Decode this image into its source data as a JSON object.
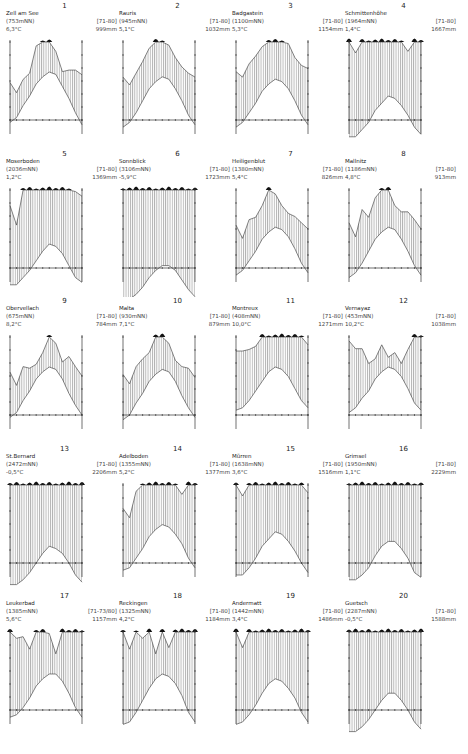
{
  "figure": {
    "layout": {
      "columns": 4,
      "rows": 5
    }
  },
  "chart_data": {
    "type": "climate-diagram-grid",
    "months": [
      "J",
      "F",
      "M",
      "A",
      "M",
      "J",
      "J",
      "A",
      "S",
      "O",
      "N",
      "D"
    ],
    "period_default": "[71-80]",
    "stations": [
      {
        "num": "1",
        "name": "Zell am See",
        "alt": "(753mNN)",
        "period": "[71-80]",
        "temp": "6,3°C",
        "precip": "999mm",
        "p": [
          48,
          35,
          52,
          60,
          95,
          100,
          100,
          88,
          62,
          64,
          64,
          58
        ],
        "t": [
          -1,
          1,
          6,
          10,
          15,
          18,
          20,
          19,
          14,
          9,
          3,
          -2
        ]
      },
      {
        "num": "2",
        "name": "Rauris",
        "alt": "(945mNN)",
        "period": "[71-80]",
        "temp": "5,1°C",
        "precip": "1032mm",
        "p": [
          55,
          45,
          60,
          75,
          92,
          100,
          100,
          96,
          80,
          68,
          60,
          55
        ],
        "t": [
          -3,
          -1,
          3,
          8,
          13,
          16,
          18,
          17,
          13,
          8,
          2,
          -2
        ]
      },
      {
        "num": "3",
        "name": "Badgastein",
        "alt": "(1100mNN)",
        "period": "[71-80]",
        "temp": "5,3°C",
        "precip": "1154mm",
        "p": [
          62,
          55,
          72,
          82,
          94,
          100,
          100,
          100,
          98,
          80,
          70,
          66
        ],
        "t": [
          -3,
          -1,
          3,
          7,
          12,
          15,
          17,
          16,
          13,
          8,
          2,
          -2
        ]
      },
      {
        "num": "4",
        "name": "Schmittenhöhe",
        "alt": "(1964mNN)",
        "period": "[71-80]",
        "temp": "1,4°C",
        "precip": "1667mm",
        "p": [
          100,
          86,
          100,
          100,
          100,
          100,
          100,
          100,
          100,
          88,
          100,
          100
        ],
        "t": [
          -7,
          -7,
          -4,
          -1,
          4,
          7,
          10,
          9,
          6,
          2,
          -3,
          -6
        ]
      },
      {
        "num": "5",
        "name": "Moserboden",
        "alt": "(2036mNN)",
        "period": "[71-80]",
        "temp": "1,2°C",
        "precip": "1369mm",
        "p": [
          80,
          55,
          100,
          100,
          100,
          100,
          100,
          100,
          100,
          100,
          98,
          92
        ],
        "t": [
          -7,
          -7,
          -4,
          -1,
          3,
          7,
          10,
          9,
          6,
          1,
          -4,
          -6
        ]
      },
      {
        "num": "6",
        "name": "Sonnblick",
        "alt": "(3106mNN)",
        "period": "[71-80]",
        "temp": "-5,9°C",
        "precip": "1723mm",
        "p": [
          100,
          100,
          100,
          100,
          100,
          100,
          100,
          100,
          100,
          100,
          100,
          100
        ],
        "t": [
          -13,
          -13,
          -11,
          -8,
          -4,
          -1,
          1,
          1,
          -1,
          -5,
          -9,
          -12
        ]
      },
      {
        "num": "7",
        "name": "Heiligenblut",
        "alt": "(1380mNN)",
        "period": "[71-80]",
        "temp": "5,4°C",
        "precip": "826mm",
        "p": [
          55,
          38,
          62,
          65,
          80,
          100,
          95,
          80,
          70,
          66,
          58,
          50
        ],
        "t": [
          -3,
          -1,
          3,
          7,
          12,
          15,
          17,
          16,
          13,
          8,
          2,
          -2
        ]
      },
      {
        "num": "8",
        "name": "Mallnitz",
        "alt": "(1186mNN)",
        "period": "[71-80]",
        "temp": "4,8°C",
        "precip": "913mm",
        "p": [
          58,
          40,
          75,
          65,
          90,
          100,
          100,
          80,
          72,
          72,
          62,
          50
        ],
        "t": [
          -4,
          -2,
          2,
          7,
          12,
          15,
          17,
          16,
          12,
          7,
          1,
          -3
        ]
      },
      {
        "num": "9",
        "name": "Obervellach",
        "alt": "(675mNN)",
        "period": "[71-80]",
        "temp": "8,2°C",
        "precip": "784mm",
        "p": [
          55,
          38,
          62,
          60,
          65,
          80,
          100,
          92,
          68,
          75,
          62,
          50
        ],
        "t": [
          -1,
          1,
          6,
          10,
          15,
          18,
          20,
          19,
          15,
          9,
          4,
          0
        ]
      },
      {
        "num": "10",
        "name": "Malta",
        "alt": "(930mNN)",
        "period": "[71-80]",
        "temp": "7,1°C",
        "precip": "879mm",
        "p": [
          52,
          40,
          62,
          72,
          80,
          100,
          100,
          92,
          70,
          62,
          60,
          48
        ],
        "t": [
          -2,
          0,
          5,
          9,
          14,
          17,
          19,
          18,
          14,
          8,
          3,
          -1
        ]
      },
      {
        "num": "11",
        "name": "Montreux",
        "alt": "(408mNN)",
        "period": "[71-80]",
        "temp": "10,0°C",
        "precip": "1271mm",
        "p": [
          82,
          82,
          84,
          88,
          100,
          100,
          100,
          100,
          100,
          100,
          100,
          90
        ],
        "t": [
          2,
          3,
          6,
          10,
          14,
          18,
          20,
          19,
          16,
          11,
          6,
          3
        ]
      },
      {
        "num": "12",
        "name": "Vernayaz",
        "alt": "(453mNN)",
        "period": "[71-80]",
        "temp": "10,2°C",
        "precip": "1038mm",
        "p": [
          95,
          85,
          85,
          66,
          72,
          90,
          74,
          80,
          66,
          84,
          100,
          100
        ],
        "t": [
          1,
          3,
          7,
          10,
          15,
          18,
          20,
          19,
          16,
          11,
          5,
          2
        ]
      },
      {
        "num": "13",
        "name": "St.Bernard",
        "alt": "(2472mNN)",
        "period": "[71-80]",
        "temp": "-0,5°C",
        "precip": "2206mm",
        "p": [
          100,
          100,
          100,
          100,
          100,
          100,
          100,
          100,
          100,
          100,
          100,
          100
        ],
        "t": [
          -9,
          -9,
          -7,
          -4,
          0,
          4,
          7,
          6,
          4,
          0,
          -5,
          -8
        ]
      },
      {
        "num": "14",
        "name": "Adelboden",
        "alt": "(1355mNN)",
        "period": "[71-80]",
        "temp": "5,2°C",
        "precip": "1377mm",
        "p": [
          70,
          58,
          92,
          100,
          100,
          100,
          100,
          100,
          100,
          88,
          100,
          100
        ],
        "t": [
          -3,
          -2,
          2,
          6,
          11,
          14,
          16,
          15,
          12,
          8,
          2,
          -2
        ]
      },
      {
        "num": "15",
        "name": "Mürren",
        "alt": "(1638mNN)",
        "period": "[71-80]",
        "temp": "3,6°C",
        "precip": "1516mm",
        "p": [
          100,
          86,
          100,
          100,
          100,
          100,
          100,
          100,
          100,
          100,
          100,
          90
        ],
        "t": [
          -5,
          -5,
          -2,
          2,
          7,
          10,
          13,
          12,
          9,
          5,
          0,
          -4
        ]
      },
      {
        "num": "16",
        "name": "Grimsel",
        "alt": "(1950mNN)",
        "period": "[71-80]",
        "temp": "1,1°C",
        "precip": "2229mm",
        "p": [
          100,
          100,
          100,
          100,
          100,
          100,
          100,
          100,
          100,
          100,
          100,
          100
        ],
        "t": [
          -7,
          -7,
          -5,
          -2,
          3,
          7,
          9,
          9,
          6,
          2,
          -4,
          -6
        ]
      },
      {
        "num": "17",
        "name": "Leukerbad",
        "alt": "(1385mNN)",
        "period": "[71-73/80]",
        "temp": "5,6°C",
        "precip": "1157mm",
        "p": [
          100,
          92,
          94,
          78,
          100,
          100,
          98,
          72,
          100,
          100,
          100,
          100
        ],
        "t": [
          -3,
          -2,
          1,
          5,
          10,
          13,
          15,
          15,
          12,
          7,
          1,
          -3
        ]
      },
      {
        "num": "18",
        "name": "Reckingen",
        "alt": "(1325mNN)",
        "period": "[71-80]",
        "temp": "4,2°C",
        "precip": "1184mm",
        "p": [
          100,
          78,
          100,
          92,
          100,
          72,
          100,
          80,
          100,
          100,
          100,
          100
        ],
        "t": [
          -6,
          -5,
          -1,
          4,
          9,
          13,
          15,
          14,
          11,
          6,
          -1,
          -5
        ]
      },
      {
        "num": "19",
        "name": "Andermatt",
        "alt": "(1442mNN)",
        "period": "[71-80]",
        "temp": "3,4°C",
        "precip": "1486mm",
        "p": [
          100,
          80,
          100,
          100,
          100,
          100,
          100,
          100,
          100,
          100,
          100,
          100
        ],
        "t": [
          -6,
          -5,
          -2,
          2,
          7,
          11,
          13,
          12,
          9,
          5,
          -1,
          -5
        ]
      },
      {
        "num": "20",
        "name": "Guetsch",
        "alt": "(2287mNN)",
        "period": "[71-80]",
        "temp": "-0,5°C",
        "precip": "1588mm",
        "p": [
          100,
          100,
          100,
          100,
          100,
          100,
          100,
          100,
          100,
          100,
          100,
          100
        ],
        "t": [
          -9,
          -9,
          -7,
          -4,
          0,
          4,
          7,
          7,
          4,
          0,
          -5,
          -8
        ]
      }
    ]
  }
}
